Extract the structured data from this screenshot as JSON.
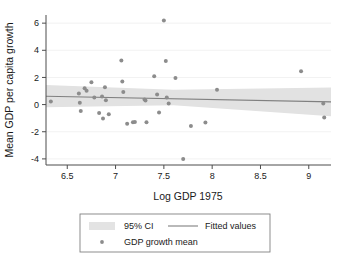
{
  "chart_data": {
    "type": "scatter",
    "title": "",
    "xlabel": "Log GDP 1975",
    "ylabel": "Mean GDP per capita growth",
    "xlim": [
      6.28,
      9.23
    ],
    "ylim": [
      -4.45,
      6.6
    ],
    "xticks": [
      6.5,
      7,
      7.5,
      8,
      8.5,
      9
    ],
    "xtick_labels": [
      "6.5",
      "7",
      "7.5",
      "8",
      "8.5",
      "9"
    ],
    "yticks": [
      -4,
      -2,
      0,
      2,
      4,
      6
    ],
    "ytick_labels": [
      "-4",
      "-2",
      "0",
      "2",
      "4",
      "6"
    ],
    "grid": "horizontal-faint",
    "legend_position": "below-plot",
    "series": [
      {
        "name": "GDP growth mean",
        "type": "scatter",
        "marker_color": "#8c8c8c",
        "points": [
          [
            6.33,
            0.22
          ],
          [
            6.62,
            0.82
          ],
          [
            6.63,
            0.13
          ],
          [
            6.64,
            -0.48
          ],
          [
            6.68,
            1.2
          ],
          [
            6.7,
            1.02
          ],
          [
            6.75,
            1.65
          ],
          [
            6.78,
            0.52
          ],
          [
            6.83,
            -0.62
          ],
          [
            6.86,
            0.6
          ],
          [
            6.87,
            -1.02
          ],
          [
            6.89,
            1.28
          ],
          [
            6.9,
            0.32
          ],
          [
            6.93,
            -0.72
          ],
          [
            7.06,
            3.25
          ],
          [
            7.07,
            1.7
          ],
          [
            7.08,
            0.92
          ],
          [
            7.12,
            -1.42
          ],
          [
            7.18,
            -1.3
          ],
          [
            7.2,
            -1.28
          ],
          [
            7.3,
            0.38
          ],
          [
            7.31,
            0.3
          ],
          [
            7.32,
            -1.3
          ],
          [
            7.4,
            2.08
          ],
          [
            7.43,
            0.74
          ],
          [
            7.45,
            -0.58
          ],
          [
            7.5,
            6.2
          ],
          [
            7.52,
            3.22
          ],
          [
            7.53,
            0.52
          ],
          [
            7.55,
            0.08
          ],
          [
            7.62,
            1.95
          ],
          [
            7.7,
            -4.0
          ],
          [
            7.78,
            -1.58
          ],
          [
            7.93,
            -1.32
          ],
          [
            8.05,
            1.1
          ],
          [
            8.92,
            2.45
          ],
          [
            9.15,
            0.08
          ],
          [
            9.16,
            -0.95
          ]
        ]
      },
      {
        "name": "Fitted values",
        "type": "line",
        "line_color": "#808080",
        "endpoints": [
          [
            6.28,
            0.62
          ],
          [
            9.23,
            0.2
          ]
        ]
      },
      {
        "name": "95% CI",
        "type": "band",
        "fill_color": "#e2e2e2",
        "upper": [
          [
            6.28,
            1.45
          ],
          [
            7.6,
            1.1
          ],
          [
            9.23,
            1.25
          ]
        ],
        "lower": [
          [
            6.28,
            -0.2
          ],
          [
            7.6,
            -0.05
          ],
          [
            9.23,
            -0.85
          ]
        ]
      }
    ]
  },
  "legend": {
    "ci_label": "95% CI",
    "fitted_label": "Fitted values",
    "scatter_label": "GDP growth mean"
  },
  "colors": {
    "marker": "#8c8c8c",
    "fit_line": "#808080",
    "ci_band": "#e3e3e3",
    "axis": "#4d4d4d",
    "grid": "#f2f2f2",
    "text": "#1a1a1a",
    "legend_border": "#808080"
  }
}
